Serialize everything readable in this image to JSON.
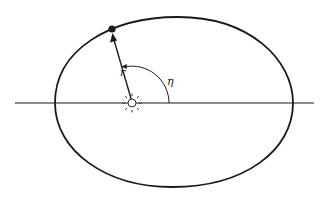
{
  "diagram": {
    "labels": {
      "radius": "r",
      "angle": "η"
    },
    "elements": {
      "orbit": "ellipse",
      "focus_body": "sun-icon",
      "orbiting_body": "planet",
      "axis": "apsidal-line"
    },
    "colors": {
      "stroke": "#1a1a1a",
      "background": "#ffffff"
    }
  }
}
